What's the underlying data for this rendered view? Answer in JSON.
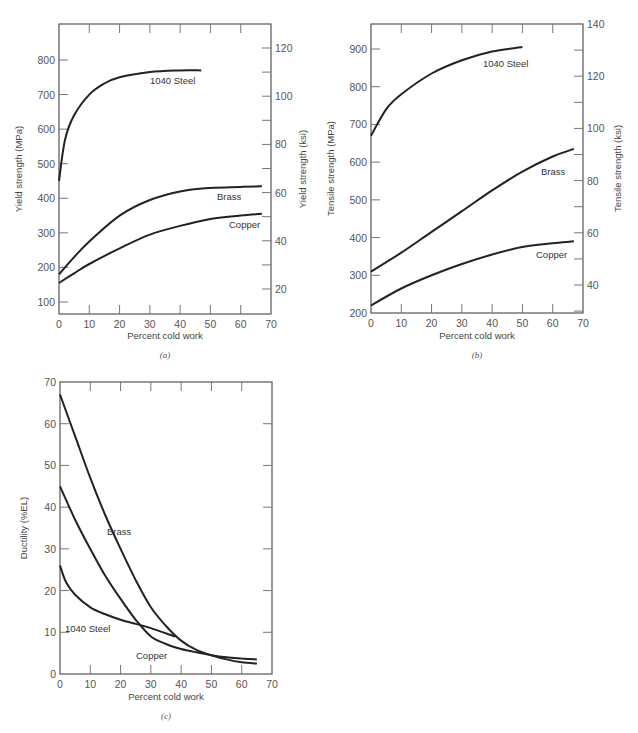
{
  "chart_data": [
    {
      "id": "a",
      "type": "line",
      "caption": "(a)",
      "xlabel": "Percent cold work",
      "ylabel": "Yield strength (MPa)",
      "ylabel_right": "Yield strength (ksi)",
      "xlim": [
        0,
        70
      ],
      "ylim": [
        65,
        904
      ],
      "xticks": [
        0,
        10,
        20,
        30,
        40,
        50,
        60,
        70
      ],
      "yticks": [
        100,
        200,
        300,
        400,
        500,
        600,
        700,
        800
      ],
      "yticks_right": [
        20,
        40,
        60,
        80,
        100,
        120
      ],
      "grid": false,
      "series": [
        {
          "name": "1040 Steel",
          "x": [
            0,
            2,
            5,
            10,
            15,
            20,
            30,
            40,
            47
          ],
          "values": [
            450,
            570,
            640,
            700,
            732,
            750,
            765,
            770,
            770
          ]
        },
        {
          "name": "Brass",
          "x": [
            0,
            5,
            10,
            20,
            30,
            40,
            50,
            60,
            67
          ],
          "values": [
            180,
            230,
            275,
            350,
            395,
            420,
            430,
            433,
            435
          ]
        },
        {
          "name": "Copper",
          "x": [
            0,
            5,
            10,
            20,
            30,
            40,
            50,
            60,
            67
          ],
          "values": [
            155,
            183,
            210,
            255,
            295,
            320,
            340,
            350,
            355
          ]
        }
      ],
      "labels": [
        {
          "text": "1040 Steel",
          "x": 150,
          "y": 84
        },
        {
          "text": "Brass",
          "x": 217,
          "y": 200
        },
        {
          "text": "Copper",
          "x": 229,
          "y": 228
        }
      ]
    },
    {
      "id": "b",
      "type": "line",
      "caption": "(b)",
      "xlabel": "Percent cold work",
      "ylabel": "Tensile strength (MPa)",
      "ylabel_right": "Tensile strength (ksi)",
      "xlim": [
        0,
        70
      ],
      "ylim": [
        200,
        966
      ],
      "xticks": [
        0,
        10,
        20,
        30,
        40,
        50,
        60,
        70
      ],
      "yticks": [
        200,
        300,
        400,
        500,
        600,
        700,
        800,
        900
      ],
      "yticks_right": [
        40,
        60,
        80,
        100,
        120,
        140
      ],
      "grid": false,
      "series": [
        {
          "name": "1040 Steel",
          "x": [
            0,
            5,
            10,
            20,
            30,
            40,
            50
          ],
          "values": [
            670,
            740,
            780,
            835,
            870,
            893,
            905
          ]
        },
        {
          "name": "Brass",
          "x": [
            0,
            10,
            20,
            30,
            40,
            50,
            60,
            67
          ],
          "values": [
            310,
            360,
            415,
            470,
            525,
            575,
            615,
            635
          ]
        },
        {
          "name": "Copper",
          "x": [
            0,
            10,
            20,
            30,
            40,
            50,
            60,
            67
          ],
          "values": [
            220,
            265,
            300,
            330,
            355,
            375,
            385,
            390
          ]
        }
      ],
      "labels": [
        {
          "text": "1040 Steel",
          "x": 483,
          "y": 67
        },
        {
          "text": "Brass",
          "x": 541,
          "y": 175
        },
        {
          "text": "Copper",
          "x": 536,
          "y": 258
        }
      ]
    },
    {
      "id": "c",
      "type": "line",
      "caption": "(c)",
      "xlabel": "Percent cold work",
      "ylabel": "Ductility (%EL)",
      "xlim": [
        0,
        70
      ],
      "ylim": [
        0,
        70
      ],
      "xticks": [
        0,
        10,
        20,
        30,
        40,
        50,
        60,
        70
      ],
      "yticks": [
        0,
        10,
        20,
        30,
        40,
        50,
        60,
        70
      ],
      "grid": false,
      "series": [
        {
          "name": "Brass",
          "x": [
            0,
            5,
            10,
            15,
            20,
            25,
            30,
            35,
            40,
            45,
            50,
            55,
            60,
            65
          ],
          "values": [
            67,
            57,
            47,
            38,
            30,
            22.5,
            16,
            11.5,
            8,
            5.8,
            4.5,
            3.5,
            2.8,
            2.5
          ]
        },
        {
          "name": "Copper",
          "x": [
            0,
            5,
            10,
            15,
            20,
            25,
            30,
            35,
            40,
            45,
            50,
            55,
            60,
            65
          ],
          "values": [
            45,
            37,
            30,
            23.5,
            18,
            13,
            9,
            7.2,
            6,
            5.2,
            4.5,
            4,
            3.7,
            3.5
          ]
        },
        {
          "name": "1040 Steel",
          "x": [
            0,
            2,
            5,
            10,
            15,
            20,
            25,
            30,
            38
          ],
          "values": [
            26,
            22,
            19,
            16,
            14.3,
            13,
            12,
            11,
            9
          ]
        }
      ],
      "labels": [
        {
          "text": "Brass",
          "x": 107,
          "y": 535
        },
        {
          "text": "1040 Steel",
          "x": 65,
          "y": 632
        },
        {
          "text": "Copper",
          "x": 136,
          "y": 659
        }
      ]
    }
  ]
}
